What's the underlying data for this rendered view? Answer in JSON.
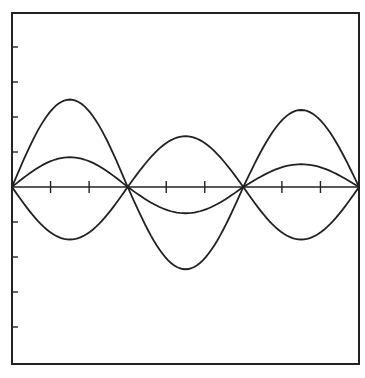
{
  "chart_data": {
    "type": "line",
    "title": "",
    "xlabel": "",
    "ylabel": "",
    "grid": false,
    "legend": null,
    "xlim": [
      0,
      3
    ],
    "ylim": [
      -5,
      5
    ],
    "x_ticks_per_segment": 3,
    "x_tick_count": 9,
    "y_tick_count": 9,
    "nodes_x": [
      0,
      1,
      2,
      3
    ],
    "series": [
      {
        "name": "upper-outer",
        "segments": [
          {
            "x0": 0,
            "x1": 1,
            "amplitude": 2.5
          },
          {
            "x0": 1,
            "x1": 2,
            "amplitude": 1.45
          },
          {
            "x0": 2,
            "x1": 3,
            "amplitude": 2.2
          }
        ]
      },
      {
        "name": "upper-inner",
        "segments": [
          {
            "x0": 0,
            "x1": 1,
            "amplitude": 0.85
          },
          {
            "x0": 1,
            "x1": 2,
            "amplitude": -0.75
          },
          {
            "x0": 2,
            "x1": 3,
            "amplitude": 0.65
          }
        ]
      },
      {
        "name": "lower-inner",
        "segments": [
          {
            "x0": 0,
            "x1": 1,
            "amplitude": -1.5
          },
          {
            "x0": 1,
            "x1": 2,
            "amplitude": -2.35
          },
          {
            "x0": 2,
            "x1": 3,
            "amplitude": -1.5
          }
        ]
      }
    ]
  },
  "style": {
    "ink": "#222222",
    "paper": "#ffffff"
  }
}
